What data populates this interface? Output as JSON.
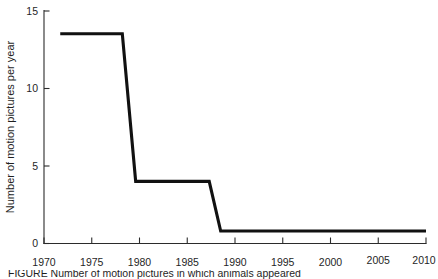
{
  "chart_data": {
    "type": "line",
    "title": "",
    "subtitle": "",
    "xlabel": "",
    "ylabel": "Number of motion pictures per year",
    "xlim": [
      1970,
      2010
    ],
    "ylim": [
      0,
      15
    ],
    "xticks": [
      1970,
      1975,
      1980,
      1985,
      1990,
      1995,
      2000,
      2005,
      2010
    ],
    "xticklabels": [
      "1970",
      "1975",
      "1980",
      "1985",
      "1990",
      "1995",
      "2000",
      "2005",
      "2010"
    ],
    "yticks": [
      0,
      5,
      10,
      15
    ],
    "yticklabels": [
      "0",
      "5",
      "10",
      "15"
    ],
    "grid": false,
    "legend": false,
    "line_color": "#111111",
    "axis_color": "#2b2b2b",
    "series": [
      {
        "name": "Motion pictures per year",
        "x": [
          1971.7,
          1978.2,
          1979.6,
          1987.3,
          1988.5,
          2010.0
        ],
        "values": [
          13.5,
          13.5,
          4.0,
          4.0,
          0.8,
          0.8
        ]
      }
    ],
    "step_description": "Step function: about 13.5 films/year from ~1972 to ~1978, dropping to about 4 per year from ~1980 to ~1987, then dropping to about 0.8 per year from ~1989 through 2010.",
    "annotations": []
  },
  "figure": {
    "caption_partial": "FIGURE    Number of motion pictures in which animals appeared"
  }
}
